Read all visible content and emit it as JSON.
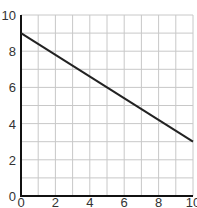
{
  "chart_data": {
    "type": "line",
    "title": "",
    "xlabel": "",
    "ylabel": "",
    "xlim": [
      0,
      10
    ],
    "ylim": [
      0,
      10
    ],
    "grid": true,
    "grid_step": 1,
    "x_ticks": [
      0,
      2,
      4,
      6,
      8,
      10
    ],
    "y_ticks": [
      0,
      2,
      4,
      6,
      8,
      10
    ],
    "x_tick_labels": [
      "0",
      "2",
      "4",
      "6",
      "8",
      "10"
    ],
    "y_tick_labels": [
      "0",
      "2",
      "4",
      "6",
      "8",
      "10"
    ],
    "series": [
      {
        "name": "line",
        "x": [
          0,
          10
        ],
        "y": [
          9,
          3
        ],
        "color": "#222222"
      }
    ],
    "legend": null
  },
  "colors": {
    "axis": "#111111",
    "grid": "#c8c8c8",
    "line": "#222222",
    "tick_text": "#333333"
  }
}
